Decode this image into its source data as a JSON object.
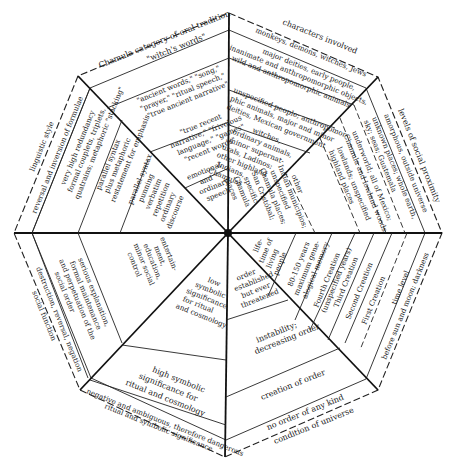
{
  "sectors": {
    "top_left": {
      "category_label": "Chamula category of oral tradition",
      "bands": [
        "\"witch's words\"",
        "\"ancient words,\" \"song,\" \"prayer,\" \"ritual speech,\" \"true ancient narrative\"",
        "\"true recent narrative,\" \"frivolous language,\" \"games\" \"recent words\"",
        "emotional and ordinary speech"
      ]
    },
    "top_right": {
      "category_label": "characters involved",
      "bands": [
        "monkeys, demons, witches, Jews",
        "major deities, early people, inanimate and anthropomorphic objects, wild and anthropomorphic animals",
        "unspecified people; anthropomorphic animals, major and minor deities, Mexican government",
        "witches, ordinary animals, minor supernaturals, Ladinos; other highland Indians, Chamulas"
      ]
    },
    "right_upper": {
      "category_label": "levels of social proximity",
      "bands": [
        "amorphous, outside universe",
        "unknown places; whole earth, sky; seas; Guatemala",
        "underworld; all of Mexico; Chamula and lowland woods",
        "lowlands; unspecified highland places",
        "other Indian municipios; unspecified Chamula places; San Cristóbal; specific Chamula places"
      ]
    },
    "right_lower": {
      "category_label": "time level",
      "bands": [
        "before sun and moon; darkness",
        "First Creation",
        "Second Creation",
        "Third Creation",
        "Fourth Creation (unspecified years)",
        "80-150 years maximum genealogical memory",
        "lifetime of living people"
      ]
    },
    "bottom_right": {
      "category_label": "condition of universe",
      "bands": [
        "no order of any kind",
        "creation of order",
        "instability; decreasing order",
        "order established but ever threatened"
      ]
    },
    "bottom_left": {
      "category_label": "ritual and symbolic significance",
      "bands": [
        "negative and ambiguous, therefore dangerous",
        "high symbolic significance for ritual and cosmology",
        "low symbolic significance for ritual and cosmology"
      ]
    },
    "left_lower": {
      "category_label": "social function",
      "bands": [
        "destruction, reversal, negation",
        "serious explanation, formal maintenance and perpetuation of the social order",
        "entertainment, education, minor social control"
      ]
    },
    "left_upper": {
      "category_label": "linguistic style",
      "bands": [
        "reversal and inversion of formulae",
        "very high redundancy formal couplets, triplets, quatrains; metaphoric \"stacking\"",
        "parallel syntax plus metaphoric restatement for emphasis",
        "parallel syntax punning verbatim repetition ordinary discourse"
      ]
    }
  },
  "text": {
    "tl_cat": "Chamula category of oral tradition",
    "tl_b1": "\"witch's words\"",
    "tl_b2a": "\"ancient words,\" \"song,\"",
    "tl_b2b": "\"prayer,\" \"ritual speech,\"",
    "tl_b2c": "\"true ancient narrative\"",
    "tl_b3a": "\"true recent",
    "tl_b3b": "narrative,\" \"frivolous",
    "tl_b3c": "language,\" \"games\"",
    "tl_b3d": "\"recent words\"",
    "tl_b4a": "emotional",
    "tl_b4b": "and",
    "tl_b4c": "ordinary",
    "tl_b4d": "speech",
    "tr_cat": "characters involved",
    "tr_b1": "monkeys, demons, witches, Jews",
    "tr_b2a": "major deities, early people,",
    "tr_b2b": "inanimate and anthropomorphic objects,",
    "tr_b2c": "wild and anthropomorphic animals",
    "tr_b3a": "unspecified people; anthropomor-",
    "tr_b3b": "phic animals, major and minor",
    "tr_b3c": "deities, Mexican government",
    "tr_b4a": "witches,",
    "tr_b4b": "ordinary animals,",
    "tr_b4c": "minor supernat-",
    "tr_b4d": "urals, Ladinos;",
    "tr_b4e": "other highland",
    "tr_b4f": "Indians,",
    "tr_b4g": "Chamulas",
    "ru_cat": "levels of social proximity",
    "ru_b1": "amorphous, outside universe",
    "ru_b2a": "unknown places; whole earth,",
    "ru_b2b": "sky; seas; Guatemala",
    "ru_b3a": "underworld; all of Mexico;",
    "ru_b3b": "Chamula and lowland woods",
    "ru_b4a": "lowlands; unspecified",
    "ru_b4b": "highland places",
    "ru_b5a": "other",
    "ru_b5b": "Indian municipios;",
    "ru_b5c": "unspecified",
    "ru_b5d": "Chamula places;",
    "ru_b5e": "San Cristóbal;",
    "ru_b5f": "specific",
    "ru_b5g": "Chamula",
    "ru_b5h": "places",
    "rl_cat": "time level",
    "rl_b1": "before sun and moon; darkness",
    "rl_b2": "First Creation",
    "rl_b3": "Second Creation",
    "rl_b4": "Third Creation",
    "rl_b5a": "Fourth Creation",
    "rl_b5b": "(unspecified years)",
    "rl_b6a": "80-150 years",
    "rl_b6b": "maximum gene-",
    "rl_b6c": "alogical memory",
    "rl_b7a": "life-",
    "rl_b7b": "time of",
    "rl_b7c": "living",
    "rl_b7d": "people",
    "br_cat": "condition of universe",
    "br_b1": "no order of any kind",
    "br_b2": "creation of order",
    "br_b3a": "instability;",
    "br_b3b": "decreasing order",
    "br_b4a": "order",
    "br_b4b": "established",
    "br_b4c": "but ever",
    "br_b4d": "threatened",
    "bl_cat": "ritual and symbolic significance",
    "bl_b1": "negative and ambiguous, therefore dangerous",
    "bl_b2a": "high symbolic",
    "bl_b2b": "significance for",
    "bl_b2c": "ritual and cosmology",
    "bl_b3a": "low",
    "bl_b3b": "symbolic",
    "bl_b3c": "significance",
    "bl_b3d": "for ritual",
    "bl_b3e": "and cosmology",
    "ll_cat": "social function",
    "ll_b1": "destruction, reversal, negation",
    "ll_b2a": "serious explanation,",
    "ll_b2b": "formal maintenance",
    "ll_b2c": "and perpetuation of the",
    "ll_b2d": "social order",
    "ll_b3a": "entertain-",
    "ll_b3b": "ment,",
    "ll_b3c": "education,",
    "ll_b3d": "minor social",
    "ll_b3e": "control",
    "lu_cat": "linguistic style",
    "lu_b1": "reversal and inversion of formulae",
    "lu_b2a": "very high redundancy",
    "lu_b2b": "formal couplets, triplets,",
    "lu_b2c": "quatrains; metaphoric \"stacking\"",
    "lu_b3a": "parallel syntax",
    "lu_b3b": "plus metaphoric",
    "lu_b3c": "restatement for emphasis",
    "lu_b4a": "parallel syntax",
    "lu_b4b": "punning",
    "lu_b4c": "verbatim",
    "lu_b4d": "repetition",
    "lu_b4e": "ordinary",
    "lu_b4f": "discourse"
  }
}
